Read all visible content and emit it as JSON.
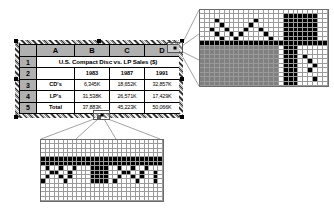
{
  "document": {
    "kind": "spreadsheet-with-magnified-callouts",
    "background_color": "#ffffff"
  },
  "spreadsheet": {
    "name": "sales-table",
    "selected": true,
    "selection_border_style": "hatched-marching-ants",
    "column_headers": [
      "",
      "A",
      "B",
      "C",
      "D"
    ],
    "row_numbers": [
      "1",
      "2",
      "3",
      "4",
      "5"
    ],
    "title": "U.S. Compact Disc vs. LP Sales ($)",
    "years": [
      "1983",
      "1987",
      "1991"
    ],
    "rows": [
      {
        "label": "CD's",
        "values": [
          "6,345K",
          "18,652K",
          "32,857K"
        ]
      },
      {
        "label": "LP's",
        "values": [
          "31,538K",
          "26,571K",
          "17,429K"
        ]
      },
      {
        "label": "Total",
        "values": [
          "37,883K",
          "45,223K",
          "50,066K"
        ]
      }
    ],
    "handles": [
      "top-left",
      "top-center",
      "top-right",
      "middle-left",
      "middle-right",
      "bottom-left",
      "bottom-center",
      "bottom-right"
    ],
    "header_fill": "#b0b0b0",
    "cell_fill": "#ffffff",
    "gridline_color": "#000000"
  },
  "callouts": [
    {
      "id": "top-right-callout",
      "label": "magnified-pixels-corner",
      "source": "table-top-right-corner",
      "cols": 26,
      "rows": 17,
      "cell_colors": {
        "white": "#ffffff",
        "black": "#000000",
        "gray": "#808080"
      },
      "grid_line_color": "#9a9a9a",
      "pattern": [
        "wwwwwwwwwwwwwwwwwwwwwwwwww",
        "wwwwwwwwwwwwwwwwwkkkkkkkww",
        "wwwkwwwwwwwkwwwwwkkkkkkkww",
        "wwwwkwwwwwkwwwwwwkkkkkkkww",
        "wwkwwkwwwkwwkwwwwkkkkkkkww",
        "wwwkwwkwkwwwwkwwwkkkkkkkww",
        "wwwwkwwkwwwwwwkwwkkkkkkkww",
        "kkkkkkkkkkkkkkkkkkkkkkkkkk",
        "ggggggggggggggggwkkkwwwwww",
        "ggggggggggggggggwkkkwwwwww",
        "ggggggggggggggggwkkkwkwwww",
        "ggggggggggggggggwkkkwwkwww",
        "ggggggggggggggggwkkkwwwkww",
        "ggggggggggggggggwkkkwwkwww",
        "ggggggggggggggggwkkkwwwwww",
        "ggggggggggggggggwkkkwwwkww",
        "ggggggggggggggggwkkkwwwwww"
      ]
    },
    {
      "id": "bottom-callout",
      "label": "magnified-pixels-bottom-handle",
      "source": "table-bottom-center-handle",
      "cols": 27,
      "rows": 14,
      "cell_colors": {
        "white": "#ffffff",
        "black": "#000000",
        "gray": "#808080"
      },
      "grid_line_color": "#9a9a9a",
      "pattern": [
        "wwwwwwwwwwwwwwwwwwwwwwwwwww",
        "wwwwwwwwwwwwwwwwwwwwwwwwwww",
        "wwwwwwwwwwwwwwwwwwwwwwwwwww",
        "wwwwwwwwwwwwwwwwwwwwwwwwwww",
        "kkkkkkkkkkkkkkkkkkkkkkkkkkk",
        "kkkkkkkkkkkkkkkkkkkkkkkkkkk",
        "wkwwkwwkwwwkkkkwwkwwkwwkwww",
        "wwkkwwkwwwwkkkkwwwkkwwkwwkw",
        "wkwwkwkwwwwkkkkwwkwwkwkwwkw",
        "kwwwwkwwwwwkkkkwkwwwwkwwwkw",
        "wwwwwwwwwwwwwwwwwwwwwwwwwww",
        "wwwwwwwwwwwwwwwwwwwwwwwwwww",
        "wwwwwwwwwwwwwwwwwwwwwwwwwww",
        "wwwwwwwwwwwwwwwwwwwwwwwwwww"
      ]
    }
  ],
  "connectors": {
    "line_color": "#7a7a7a",
    "top_right": {
      "from": "sheet-top-right-box",
      "to": "top-right-callout",
      "ray_count": 4
    },
    "bottom": {
      "from": "sheet-bottom-center-box",
      "to": "bottom-callout",
      "ray_count": 4
    }
  }
}
